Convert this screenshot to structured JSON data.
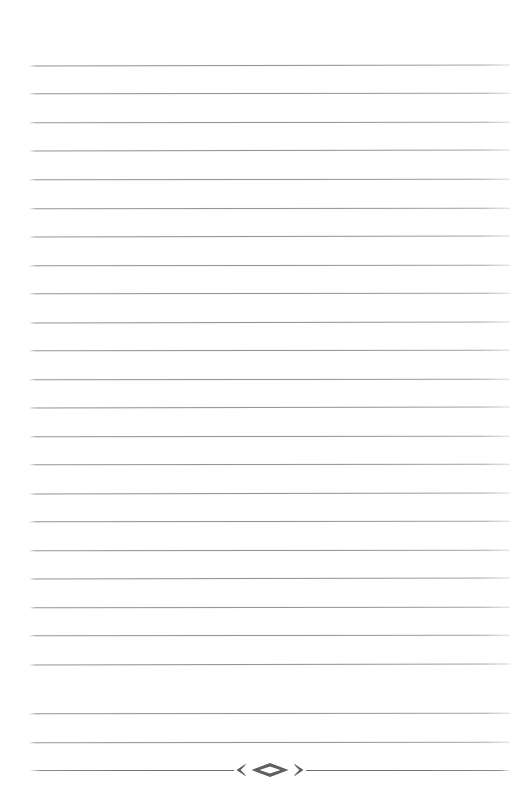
{
  "page": {
    "kind": "blank-lined-writing-page",
    "width": 528,
    "height": 811,
    "background_color": "#ffffff"
  },
  "ruling": {
    "line_color": "#949494",
    "line_count": 25,
    "writing_line_count": 24,
    "first_line_y": 65,
    "line_spacing": 28.5,
    "left_margin_x": 30,
    "right_margin_x": 510,
    "line_thickness": 1,
    "lines": [
      {
        "index": 1,
        "y": 65,
        "type": "rule"
      },
      {
        "index": 2,
        "y": 93,
        "type": "rule"
      },
      {
        "index": 3,
        "y": 122,
        "type": "rule"
      },
      {
        "index": 4,
        "y": 150,
        "type": "rule"
      },
      {
        "index": 5,
        "y": 179,
        "type": "rule"
      },
      {
        "index": 6,
        "y": 208,
        "type": "rule"
      },
      {
        "index": 7,
        "y": 236,
        "type": "rule"
      },
      {
        "index": 8,
        "y": 265,
        "type": "rule"
      },
      {
        "index": 9,
        "y": 293,
        "type": "rule"
      },
      {
        "index": 10,
        "y": 322,
        "type": "rule"
      },
      {
        "index": 11,
        "y": 350,
        "type": "rule"
      },
      {
        "index": 12,
        "y": 379,
        "type": "rule"
      },
      {
        "index": 13,
        "y": 407,
        "type": "rule"
      },
      {
        "index": 14,
        "y": 436,
        "type": "rule"
      },
      {
        "index": 15,
        "y": 464,
        "type": "rule"
      },
      {
        "index": 16,
        "y": 493,
        "type": "rule"
      },
      {
        "index": 17,
        "y": 521,
        "type": "rule"
      },
      {
        "index": 18,
        "y": 550,
        "type": "rule"
      },
      {
        "index": 19,
        "y": 578,
        "type": "rule"
      },
      {
        "index": 20,
        "y": 607,
        "type": "rule"
      },
      {
        "index": 21,
        "y": 635,
        "type": "rule"
      },
      {
        "index": 22,
        "y": 664,
        "type": "rule"
      },
      {
        "index": 23,
        "y": 713,
        "type": "rule"
      },
      {
        "index": 24,
        "y": 742,
        "type": "rule"
      },
      {
        "index": 25,
        "y": 770,
        "type": "ornament"
      }
    ]
  },
  "ornament": {
    "y": 770,
    "color": "#5e5e5e",
    "left_bracket_glyph": "❮",
    "right_bracket_glyph": "❯",
    "center_glyph": "◇",
    "description": "hollow diamond flanked by angle brackets on a tapered rule"
  },
  "content": {
    "text_lines": [],
    "note": "page is blank — no handwritten or printed text present"
  }
}
